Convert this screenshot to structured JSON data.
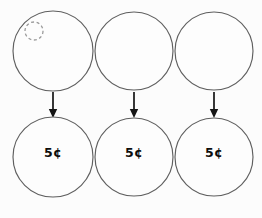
{
  "worksheet": {
    "title": "Coin value worksheet",
    "background_color": "#fcfcfc",
    "circle_stroke_color": "#5f5f5f",
    "arrow_color": "#151515",
    "label_color": "#0d0d0d",
    "placeholder_stroke_color": "#9a9a9a",
    "columns": 3,
    "rows": 2
  },
  "top_row": {
    "name": "empty-coin-row",
    "circles": [
      {
        "id": "top-circle-1",
        "cx": 53,
        "cy": 51,
        "r": 40,
        "label": "",
        "has_placeholder": true,
        "placeholder": {
          "name": "dashed-placeholder-circle",
          "cx": 34,
          "cy": 31,
          "r": 9
        }
      },
      {
        "id": "top-circle-2",
        "cx": 134,
        "cy": 51,
        "r": 39,
        "label": "",
        "has_placeholder": false
      },
      {
        "id": "top-circle-3",
        "cx": 214,
        "cy": 51,
        "r": 39,
        "label": "",
        "has_placeholder": false
      }
    ]
  },
  "arrows": [
    {
      "id": "arrow-1",
      "x": 53,
      "y_start": 92,
      "y_end": 118,
      "direction": "down"
    },
    {
      "id": "arrow-2",
      "x": 134,
      "y_start": 92,
      "y_end": 118,
      "direction": "down"
    },
    {
      "id": "arrow-3",
      "x": 214,
      "y_start": 92,
      "y_end": 118,
      "direction": "down"
    }
  ],
  "bottom_row": {
    "name": "coin-value-row",
    "circles": [
      {
        "id": "bottom-circle-1",
        "cx": 53,
        "cy": 157,
        "r": 40,
        "label": "5¢",
        "label_y": 153
      },
      {
        "id": "bottom-circle-2",
        "cx": 134,
        "cy": 157,
        "r": 39,
        "label": "5¢",
        "label_y": 153
      },
      {
        "id": "bottom-circle-3",
        "cx": 214,
        "cy": 157,
        "r": 39,
        "label": "5¢",
        "label_y": 153
      }
    ]
  }
}
